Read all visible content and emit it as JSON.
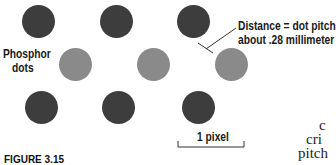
{
  "figure": {
    "caption_fragment": "FIGURE 3.15",
    "labels": {
      "phosphor_line1": "Phosphor",
      "phosphor_line2": "dots",
      "distance_line1": "Distance = dot  pitch",
      "distance_line2": "about .28 millimeter",
      "pixel": "1 pixel"
    },
    "body_text_fragments": [
      "c",
      "cri",
      "pitch"
    ],
    "colors": {
      "dark_dot": "#3d3d3d",
      "light_dot": "#8a8a8a",
      "background": "#ffffff"
    },
    "dots": [
      {
        "row": 1,
        "shade": "dark",
        "cx": 38,
        "cy": 22
      },
      {
        "row": 1,
        "shade": "dark",
        "cx": 116,
        "cy": 22
      },
      {
        "row": 1,
        "shade": "dark",
        "cx": 193,
        "cy": 22
      },
      {
        "row": 2,
        "shade": "light",
        "cx": 76,
        "cy": 64
      },
      {
        "row": 2,
        "shade": "light",
        "cx": 154,
        "cy": 64
      },
      {
        "row": 2,
        "shade": "light",
        "cx": 232,
        "cy": 64
      },
      {
        "row": 3,
        "shade": "dark",
        "cx": 41,
        "cy": 107
      },
      {
        "row": 3,
        "shade": "dark",
        "cx": 118,
        "cy": 107
      },
      {
        "row": 3,
        "shade": "dark",
        "cx": 198,
        "cy": 107
      }
    ]
  }
}
